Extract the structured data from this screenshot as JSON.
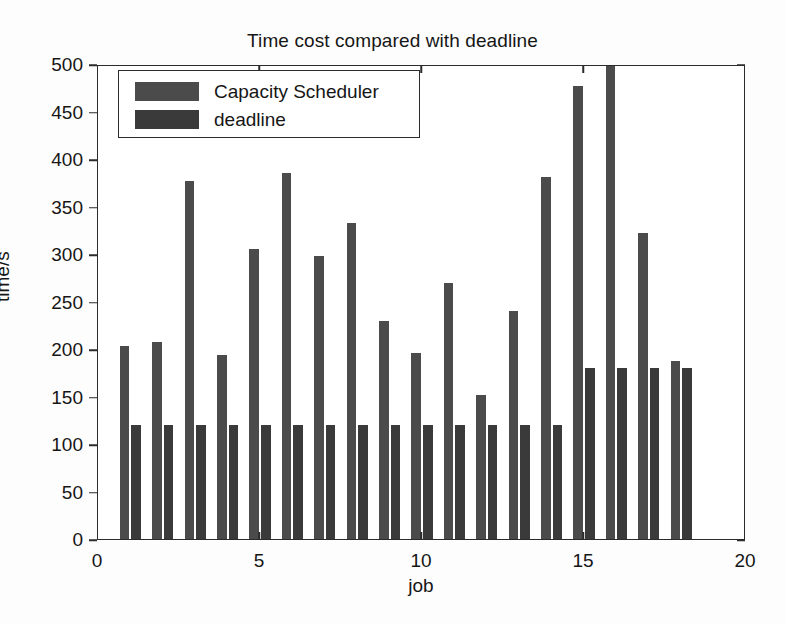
{
  "chart_data": {
    "type": "bar",
    "title": "Time cost compared with deadline",
    "xlabel": "job",
    "ylabel": "time/s",
    "xlim": [
      0,
      20
    ],
    "ylim": [
      0,
      500
    ],
    "xticks": [
      0,
      5,
      10,
      15,
      20
    ],
    "yticks": [
      0,
      50,
      100,
      150,
      200,
      250,
      300,
      350,
      400,
      450,
      500
    ],
    "grid": false,
    "legend_position": "top-left",
    "categories": [
      1,
      2,
      3,
      4,
      5,
      6,
      7,
      8,
      9,
      10,
      11,
      12,
      13,
      14,
      15,
      16,
      17,
      18
    ],
    "series": [
      {
        "name": "Capacity Scheduler",
        "color": "#4b4b4b",
        "values": [
          203,
          207,
          377,
          194,
          305,
          385,
          298,
          333,
          230,
          196,
          269,
          152,
          240,
          381,
          477,
          510,
          322,
          187
        ]
      },
      {
        "name": "deadline",
        "color": "#3a3a3a",
        "values": [
          120,
          120,
          120,
          120,
          120,
          120,
          120,
          120,
          120,
          120,
          120,
          120,
          120,
          120,
          180,
          180,
          180,
          180
        ]
      }
    ]
  },
  "legend": {
    "entries": [
      {
        "label": "Capacity Scheduler"
      },
      {
        "label": "deadline"
      }
    ]
  }
}
